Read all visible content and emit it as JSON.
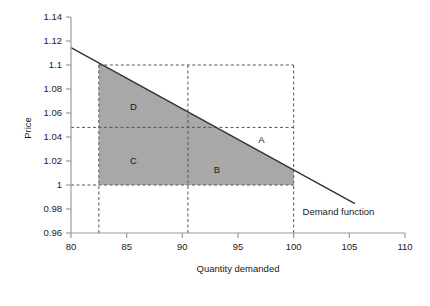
{
  "chart_data": {
    "type": "line",
    "title": "",
    "xlabel": "Quantity demanded",
    "ylabel": "Price",
    "xlim": [
      80,
      110
    ],
    "ylim": [
      0.96,
      1.14
    ],
    "grid": false,
    "legend_position": "inline-right",
    "x_ticks": [
      "80",
      "85",
      "90",
      "95",
      "100",
      "105",
      "110"
    ],
    "x_tick_values": [
      80,
      85,
      90,
      95,
      100,
      105,
      110
    ],
    "y_ticks": [
      "0.96",
      "0.98",
      "1",
      "1.02",
      "1.04",
      "1.06",
      "1.08",
      "1.1",
      "1.12",
      "1.14"
    ],
    "y_tick_values": [
      0.96,
      0.98,
      1,
      1.02,
      1.04,
      1.06,
      1.08,
      1.1,
      1.12,
      1.14
    ],
    "series": [
      {
        "name": "Demand function",
        "type": "line",
        "x": [
          80,
          105.5
        ],
        "y": [
          1.1145,
          0.9845
        ],
        "color": "#333333"
      }
    ],
    "annotations": [
      {
        "label": "Demand function",
        "x": 100.8,
        "y": 0.9775
      },
      {
        "label": "A",
        "x": 97.1,
        "y": 1.0375
      },
      {
        "label": "B",
        "x": 93.1,
        "y": 1.0125
      },
      {
        "label": "C",
        "x": 85.6,
        "y": 1.0205
      },
      {
        "label": "D",
        "x": 85.6,
        "y": 1.0655
      }
    ],
    "reference_lines": [
      {
        "orientation": "vertical",
        "value": 82.5,
        "from": 0.96,
        "to": 1.1,
        "style": "dashed"
      },
      {
        "orientation": "vertical",
        "value": 90.5,
        "from": 0.96,
        "to": 1.1,
        "style": "dashed"
      },
      {
        "orientation": "vertical",
        "value": 100,
        "from": 0.96,
        "to": 1.1,
        "style": "dashed"
      },
      {
        "orientation": "horizontal",
        "value": 1.1,
        "from": 82.5,
        "to": 100,
        "style": "dashed"
      },
      {
        "orientation": "horizontal",
        "value": 1.048,
        "from": 80,
        "to": 100,
        "style": "dashed"
      },
      {
        "orientation": "horizontal",
        "value": 1.0,
        "from": 80,
        "to": 100,
        "style": "dashed"
      }
    ],
    "shaded_regions": [
      {
        "name": "consumer-surplus-region",
        "color": "#a8a8a8",
        "description": "Area bounded below by price 1.00, left by quantity 82.5, right by quantity 100, and above by the demand function",
        "vertices": [
          [
            82.5,
            1.0
          ],
          [
            82.5,
            1.1
          ],
          [
            100,
            1.0
          ],
          [
            100,
            1.0
          ]
        ]
      }
    ]
  },
  "labels": {
    "price_axis": "Price",
    "quantity_axis": "Quantity demanded",
    "demand_function": "Demand function",
    "region_a": "A",
    "region_b": "B",
    "region_c": "C",
    "region_d": "D"
  },
  "colors": {
    "shade": "#a8a8a8",
    "line": "#333333",
    "axis": "#9a9a9a",
    "dash": "#555555",
    "text": "#1a1a1a"
  }
}
